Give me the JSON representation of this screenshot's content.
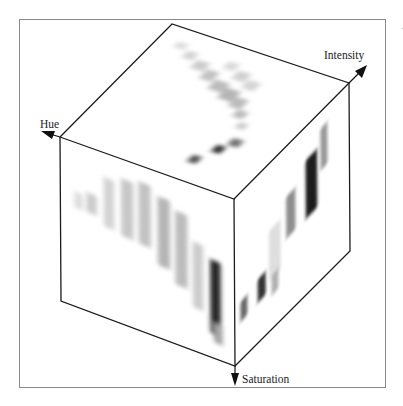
{
  "figure": {
    "type": "3d-histogram-cube",
    "axes": [
      {
        "id": "hue",
        "label": "Hue",
        "direction": "left-up"
      },
      {
        "id": "intensity",
        "label": "Intensity",
        "direction": "right-up"
      },
      {
        "id": "saturation",
        "label": "Saturation",
        "direction": "down"
      }
    ],
    "colors": {
      "edge": "#1c1c1c",
      "frame": "#8a8a8a",
      "background": "#ffffff",
      "density_dark": "#111111",
      "density_light": "#f2f2f2"
    },
    "faces": {
      "top": {
        "name": "Hue-Intensity projection",
        "blobs": [
          {
            "u": 0.1,
            "v": 0.1,
            "w": 0.06,
            "h": 0.05,
            "d": 0.1
          },
          {
            "u": 0.18,
            "v": 0.14,
            "w": 0.06,
            "h": 0.06,
            "d": 0.15
          },
          {
            "u": 0.26,
            "v": 0.18,
            "w": 0.07,
            "h": 0.07,
            "d": 0.18
          },
          {
            "u": 0.34,
            "v": 0.22,
            "w": 0.07,
            "h": 0.08,
            "d": 0.22
          },
          {
            "u": 0.42,
            "v": 0.27,
            "w": 0.08,
            "h": 0.08,
            "d": 0.25
          },
          {
            "u": 0.5,
            "v": 0.3,
            "w": 0.08,
            "h": 0.09,
            "d": 0.28
          },
          {
            "u": 0.58,
            "v": 0.34,
            "w": 0.07,
            "h": 0.08,
            "d": 0.25
          },
          {
            "u": 0.4,
            "v": 0.12,
            "w": 0.06,
            "h": 0.06,
            "d": 0.12
          },
          {
            "u": 0.48,
            "v": 0.16,
            "w": 0.07,
            "h": 0.07,
            "d": 0.16
          },
          {
            "u": 0.56,
            "v": 0.2,
            "w": 0.07,
            "h": 0.07,
            "d": 0.14
          },
          {
            "u": 0.64,
            "v": 0.42,
            "w": 0.06,
            "h": 0.06,
            "d": 0.25
          },
          {
            "u": 0.7,
            "v": 0.5,
            "w": 0.05,
            "h": 0.05,
            "d": 0.18
          },
          {
            "u": 0.74,
            "v": 0.62,
            "w": 0.06,
            "h": 0.06,
            "d": 0.55
          },
          {
            "u": 0.7,
            "v": 0.7,
            "w": 0.05,
            "h": 0.06,
            "d": 0.85
          },
          {
            "u": 0.64,
            "v": 0.82,
            "w": 0.05,
            "h": 0.06,
            "d": 0.7
          }
        ]
      },
      "front": {
        "name": "Hue-Saturation projection",
        "blobs": [
          {
            "u": 0.08,
            "v": 0.3,
            "w": 0.05,
            "h": 0.1,
            "d": 0.1
          },
          {
            "u": 0.15,
            "v": 0.28,
            "w": 0.06,
            "h": 0.12,
            "d": 0.18
          },
          {
            "u": 0.25,
            "v": 0.15,
            "w": 0.06,
            "h": 0.3,
            "d": 0.15
          },
          {
            "u": 0.35,
            "v": 0.12,
            "w": 0.07,
            "h": 0.35,
            "d": 0.2
          },
          {
            "u": 0.45,
            "v": 0.1,
            "w": 0.07,
            "h": 0.38,
            "d": 0.22
          },
          {
            "u": 0.56,
            "v": 0.15,
            "w": 0.07,
            "h": 0.42,
            "d": 0.28
          },
          {
            "u": 0.66,
            "v": 0.2,
            "w": 0.07,
            "h": 0.45,
            "d": 0.25
          },
          {
            "u": 0.76,
            "v": 0.35,
            "w": 0.06,
            "h": 0.4,
            "d": 0.18
          },
          {
            "u": 0.86,
            "v": 0.42,
            "w": 0.06,
            "h": 0.45,
            "d": 0.9
          },
          {
            "u": 0.88,
            "v": 0.8,
            "w": 0.05,
            "h": 0.12,
            "d": 0.35
          }
        ]
      },
      "right": {
        "name": "Intensity-Saturation projection",
        "blobs": [
          {
            "u": 0.45,
            "v": 0.3,
            "w": 0.08,
            "h": 0.25,
            "d": 0.45
          },
          {
            "u": 0.62,
            "v": 0.2,
            "w": 0.1,
            "h": 0.35,
            "d": 0.95
          },
          {
            "u": 0.75,
            "v": 0.1,
            "w": 0.06,
            "h": 0.25,
            "d": 0.4
          },
          {
            "u": 0.3,
            "v": 0.4,
            "w": 0.1,
            "h": 0.3,
            "d": 0.1
          },
          {
            "u": 0.05,
            "v": 0.65,
            "w": 0.06,
            "h": 0.12,
            "d": 0.6
          },
          {
            "u": 0.2,
            "v": 0.62,
            "w": 0.07,
            "h": 0.14,
            "d": 0.85
          },
          {
            "u": 0.32,
            "v": 0.68,
            "w": 0.06,
            "h": 0.12,
            "d": 0.3
          }
        ]
      }
    }
  }
}
